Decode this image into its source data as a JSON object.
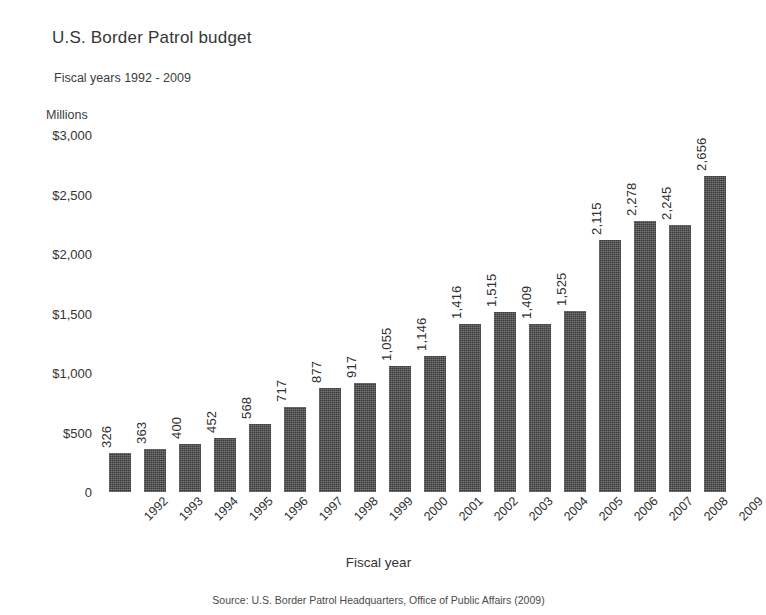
{
  "chart_data": {
    "type": "bar",
    "title": "U.S. Border Patrol budget",
    "subtitle": "Fiscal years 1992 - 2009",
    "unit_label": "Millions",
    "xlabel": "Fiscal year",
    "ylabel": "",
    "ylim": [
      0,
      3000
    ],
    "yticks": [
      3000,
      2500,
      2000,
      1500,
      1000,
      500,
      0
    ],
    "ytick_labels": [
      "$3,000",
      "$2,500",
      "$2,000",
      "$1,500",
      "$1,000",
      "$500",
      "0"
    ],
    "grid": false,
    "legend": false,
    "bar_color": "#3c3c3c",
    "categories": [
      "1992",
      "1993",
      "1994",
      "1995",
      "1996",
      "1997",
      "1998",
      "1999",
      "2000",
      "2001",
      "2002",
      "2003",
      "2004",
      "2005",
      "2006",
      "2007",
      "2008",
      "2009"
    ],
    "values": [
      326,
      363,
      400,
      452,
      568,
      717,
      877,
      917,
      1055,
      1146,
      1416,
      1515,
      1409,
      1525,
      2115,
      2278,
      2245,
      2656
    ],
    "value_labels": [
      "326",
      "363",
      "400",
      "452",
      "568",
      "717",
      "877",
      "917",
      "1,055",
      "1,146",
      "1,416",
      "1,515",
      "1,409",
      "1,525",
      "2,115",
      "2,278",
      "2,245",
      "2,656"
    ],
    "source": "Source: U.S. Border Patrol Headquarters, Office of Public Affairs (2009)"
  }
}
